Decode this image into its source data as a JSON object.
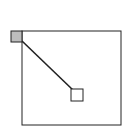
{
  "grid": {
    "top_row_cells": 10,
    "left_column_cells": 9
  },
  "source_cell": {
    "label": "A"
  },
  "target_cell": {
    "label": "X"
  },
  "colors": {
    "reference_cell_fill": "#dcdcdc",
    "line": "#222222",
    "background": "#ffffff"
  }
}
